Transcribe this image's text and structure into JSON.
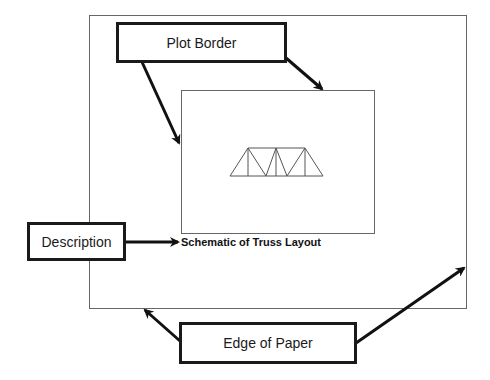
{
  "diagram": {
    "labels": {
      "plot_border": "Plot Border",
      "description": "Description",
      "edge_of_paper": "Edge of Paper"
    },
    "caption": "Schematic of Truss Layout",
    "elements": {
      "paper_edge": {
        "x": 89,
        "y": 15,
        "width": 377,
        "height": 293
      },
      "plot_border": {
        "x": 181,
        "y": 90,
        "width": 193,
        "height": 143
      },
      "truss": {
        "type": "Pratt-style truss",
        "panels": 6
      }
    },
    "colors": {
      "line": "#555555",
      "box_border": "#1a1a1a",
      "arrow": "#111111",
      "background": "#ffffff"
    }
  }
}
